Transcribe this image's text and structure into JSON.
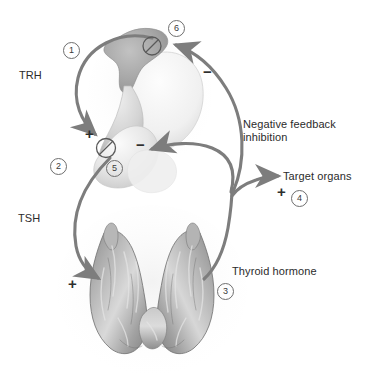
{
  "figure": {
    "background_color": "#ffffff",
    "arrow_color": "#7d7d7d",
    "text_color": "#2b2b2b",
    "hypothalamus_color": "#a9a9a9",
    "pituitary_color": "#d8d8d8",
    "thyroid_color": "#9a9a9a"
  },
  "labels": {
    "trh": "TRH",
    "tsh": "TSH",
    "negative_feedback": "Negative feedback",
    "inhibition": "inhibition",
    "target_organs": "Target organs",
    "thyroid_hormone": "Thyroid hormone"
  },
  "steps": [
    {
      "id": "1",
      "text": "1"
    },
    {
      "id": "2",
      "text": "2"
    },
    {
      "id": "3",
      "text": "3"
    },
    {
      "id": "4",
      "text": "4"
    },
    {
      "id": "5",
      "text": "5"
    },
    {
      "id": "6",
      "text": "6"
    }
  ],
  "signs": {
    "plus_pituitary": "+",
    "plus_thyroid": "+",
    "plus_target": "+",
    "minus_hypothalamus": "−",
    "minus_pituitary": "−"
  },
  "inhibition_markers": [
    {
      "id": "marker-6",
      "symbol": "slashed-circle"
    },
    {
      "id": "marker-5",
      "symbol": "slashed-circle"
    }
  ],
  "anatomy": {
    "hypothalamus": "hypothalamus",
    "pituitary": "pituitary-gland",
    "thyroid": "thyroid-gland"
  }
}
